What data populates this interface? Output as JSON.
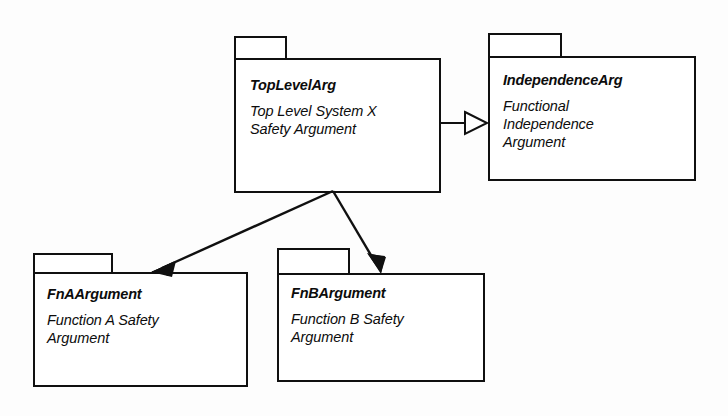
{
  "diagram": {
    "type": "uml-package-diagram",
    "title": "",
    "background_color": "#fdfdfd",
    "line_color": "#101010",
    "packages": [
      {
        "id": "toplevelarg",
        "name": "TopLevelArg",
        "description": "Top Level System X\nSafety Argument",
        "x": 234,
        "y": 36,
        "tab_width": 53,
        "tab_height": 22,
        "body_width": 207,
        "body_height": 133
      },
      {
        "id": "independencearg",
        "name": "IndependenceArg",
        "description": "Functional\nIndependence\nArgument",
        "x": 488,
        "y": 33,
        "tab_width": 74,
        "tab_height": 23,
        "body_width": 208,
        "body_height": 123
      },
      {
        "id": "fnaargument",
        "name": "FnAArgument",
        "description": "Function A Safety\nArgument",
        "x": 33,
        "y": 253,
        "tab_width": 80,
        "tab_height": 19,
        "body_width": 215,
        "body_height": 113
      },
      {
        "id": "fnbargument",
        "name": "FnBArgument",
        "description": "Function B Safety\nArgument",
        "x": 277,
        "y": 248,
        "tab_width": 73,
        "tab_height": 25,
        "body_width": 208,
        "body_height": 107
      }
    ],
    "connectors": [
      {
        "id": "toplevel-to-independence",
        "from": "toplevelarg",
        "to": "independencearg",
        "arrowhead": "hollow-triangle",
        "relationship": "generalization",
        "x1": 441,
        "y1": 123,
        "x2": 487,
        "y2": 123
      },
      {
        "id": "toplevel-to-fna",
        "from": "toplevelarg",
        "to": "fnaargument",
        "arrowhead": "solid-filled",
        "relationship": "dependency",
        "x1": 333,
        "y1": 191,
        "x2": 152,
        "y2": 272
      },
      {
        "id": "toplevel-to-fnb",
        "from": "toplevelarg",
        "to": "fnbargument",
        "arrowhead": "solid-filled",
        "relationship": "dependency",
        "x1": 333,
        "y1": 191,
        "x2": 381,
        "y2": 273
      }
    ]
  }
}
